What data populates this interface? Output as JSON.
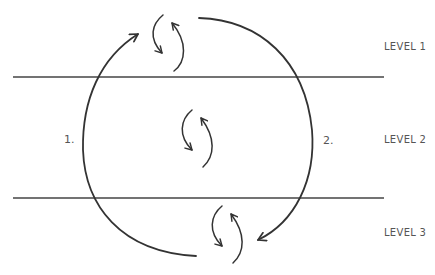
{
  "diagram": {
    "type": "cyclical-levels",
    "levels": [
      {
        "id": 1,
        "label": "LEVEL 1"
      },
      {
        "id": 2,
        "label": "LEVEL 2"
      },
      {
        "id": 3,
        "label": "LEVEL 3"
      }
    ],
    "paths": [
      {
        "id": "1",
        "label": "1.",
        "direction": "up",
        "side": "left"
      },
      {
        "id": "2",
        "label": "2.",
        "direction": "down",
        "side": "right"
      }
    ],
    "cycle_icons": [
      "level-1-cycle",
      "level-2-cycle",
      "level-3-cycle"
    ],
    "colors": {
      "stroke": "#333333",
      "divider": "#444444",
      "text": "#555555"
    }
  }
}
